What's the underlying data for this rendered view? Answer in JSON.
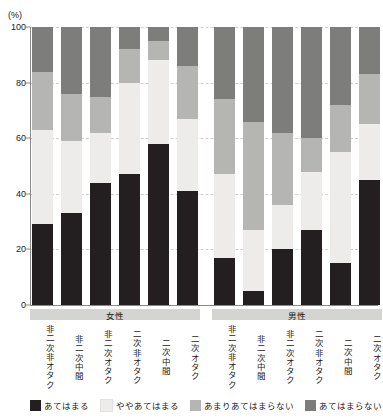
{
  "axis": {
    "unit_label": "(%)",
    "y_ticks": [
      0,
      20,
      40,
      60,
      80,
      100
    ],
    "y_min": 0,
    "y_max": 100
  },
  "groups": [
    {
      "label": "女性",
      "start": 0,
      "count": 6
    },
    {
      "label": "男性",
      "start": 6,
      "count": 6
    }
  ],
  "legend": [
    {
      "label": "あてはまる",
      "color": "#231f20"
    },
    {
      "label": "ややあてはまる",
      "color": "#edecea"
    },
    {
      "label": "あまりあてはまらない",
      "color": "#b5b5b3"
    },
    {
      "label": "あてはまらない",
      "color": "#7d7d7b"
    }
  ],
  "chart_data": {
    "type": "bar",
    "stacked": true,
    "stack_total": 100,
    "title": "",
    "xlabel": "",
    "ylabel": "(%)",
    "ylim": [
      0,
      100
    ],
    "yticks": [
      0,
      20,
      40,
      60,
      80,
      100
    ],
    "grid": true,
    "legend_position": "bottom",
    "group_labels": [
      "女性",
      "男性"
    ],
    "categories": [
      "非二次非オタク",
      "非二次中間",
      "非二次オタク",
      "二次非オタク",
      "二次中間",
      "二次オタク",
      "非二次非オタク",
      "非二次中間",
      "非二次オタク",
      "二次非オタク",
      "二次中間",
      "二次オタク"
    ],
    "series": [
      {
        "name": "あてはまる",
        "color": "#231f20",
        "values": [
          29,
          33,
          44,
          47,
          58,
          41,
          17,
          5,
          20,
          27,
          15,
          45
        ]
      },
      {
        "name": "ややあてはまる",
        "color": "#edecea",
        "values": [
          34,
          26,
          18,
          33,
          30,
          26,
          30,
          22,
          16,
          21,
          40,
          20
        ]
      },
      {
        "name": "あまりあてはまらない",
        "color": "#b5b5b3",
        "values": [
          21,
          17,
          13,
          12,
          7,
          19,
          27,
          39,
          26,
          12,
          17,
          18
        ]
      },
      {
        "name": "あてはまらない",
        "color": "#7d7d7b",
        "values": [
          16,
          24,
          25,
          8,
          5,
          14,
          26,
          34,
          38,
          40,
          28,
          17
        ]
      }
    ]
  }
}
